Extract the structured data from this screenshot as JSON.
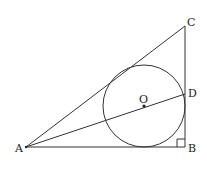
{
  "diagram": {
    "type": "geometry",
    "points": {
      "A": {
        "label": "A",
        "x": 26,
        "y": 147
      },
      "B": {
        "label": "B",
        "x": 185,
        "y": 147
      },
      "C": {
        "label": "C",
        "x": 185,
        "y": 26
      },
      "D": {
        "label": "D",
        "x": 185,
        "y": 94
      },
      "O": {
        "label": "O",
        "x": 144,
        "y": 106
      }
    },
    "circle": {
      "center": "O",
      "radius": 41
    },
    "segments": [
      "AB",
      "BC",
      "CA",
      "AD"
    ],
    "right_angle_at": "B",
    "colors": {
      "stroke": "#333333",
      "background": "#ffffff"
    }
  }
}
